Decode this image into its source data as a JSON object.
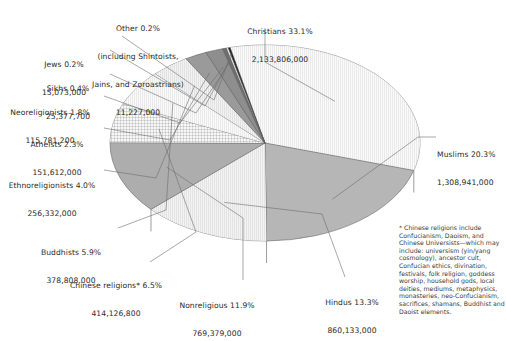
{
  "chart_data": {
    "type": "pie",
    "title": "",
    "subtitle": "",
    "xlabel": "",
    "ylabel": "",
    "legend_position": "callout-labels",
    "grid": false,
    "style": "3d-exploded-none-grayscale",
    "note_marker": "*",
    "categories": [
      "Christians",
      "Muslims",
      "Hindus",
      "Nonreligious",
      "Chinese religions*",
      "Buddhists",
      "Ethnoreligionists",
      "Atheists",
      "Neoreligionists",
      "Sikhs",
      "Jews",
      "Other (including Shintoists, Jains, and Zoroastrians)"
    ],
    "values": [
      33.1,
      20.3,
      13.3,
      11.9,
      6.5,
      5.9,
      4.0,
      2.3,
      1.8,
      0.4,
      0.2,
      0.2
    ],
    "counts": [
      2133806000,
      1308941000,
      860133000,
      769379000,
      414126800,
      378808000,
      256332000,
      151612000,
      115781200,
      25377700,
      15073000,
      11227000
    ],
    "count_labels": [
      "2,133,806,000",
      "1,308,941,000",
      "860,133,000",
      "769,379,000",
      "414,126,800",
      "378,808,000",
      "256,332,000",
      "151,612,000",
      "115,781,200",
      "25,377,700",
      "15,073,000",
      "11,227,000"
    ],
    "percent_labels": [
      "33.1%",
      "20.3%",
      "13.3%",
      "11.9%",
      "6.5%",
      "5.9%",
      "4.0%",
      "2.3%",
      "1.8%",
      "0.4%",
      "0.2%",
      "0.2%"
    ],
    "slice_colors": [
      "#dcdcdc",
      "#b6b6b6",
      "#b0b0b0",
      "#adadad",
      "#c9c9c9",
      "#e0e0e0",
      "#a8a8a8",
      "#9a9a9a",
      "#8e8e8e",
      "#6e6e6e",
      "#ffffff",
      "#1a1a1a"
    ]
  },
  "labels": {
    "christians": {
      "name": "Christians 33.1%",
      "count": "2,133,806,000"
    },
    "muslims": {
      "name": "Muslims 20.3%",
      "count": "1,308,941,000"
    },
    "hindus": {
      "name": "Hindus 13.3%",
      "count": "860,133,000"
    },
    "nonreligious": {
      "name": "Nonreligious 11.9%",
      "count": "769,379,000"
    },
    "chinese": {
      "name": "Chinese religions* 6.5%",
      "count": "414,126,800"
    },
    "buddhists": {
      "name": "Buddhists 5.9%",
      "count": "378,808,000"
    },
    "ethnoreligionists": {
      "name": "Ethnoreligionists 4.0%",
      "count": "256,332,000"
    },
    "atheists": {
      "name": "Atheists 2.3%",
      "count": "151,612,000"
    },
    "neoreligionists": {
      "name": "Neoreligionists 1.8%",
      "count": "115,781,200"
    },
    "sikhs": {
      "name": "Sikhs 0.4%",
      "count": "25,377,700"
    },
    "jews": {
      "name": "Jews 0.2%",
      "count": "15,073,000"
    },
    "other": {
      "line1": "Other 0.2%",
      "line2": "(including Shintoists,",
      "line3": "Jains, and Zoroastrians)",
      "count": "11,227,000"
    }
  },
  "footnote": {
    "text": "* Chinese religions include Confucianism, Daoism, and Chinese Universists—which may include: universism (yin/yang cosmology), ancestor cult, Confucian ethics, divination, festivals, folk religion, goddess worship, household gods, local deities, mediums, metaphysics, monasteries, neo-Confucianism, sacrifices, shamans, Buddhist and Daoist elements."
  }
}
